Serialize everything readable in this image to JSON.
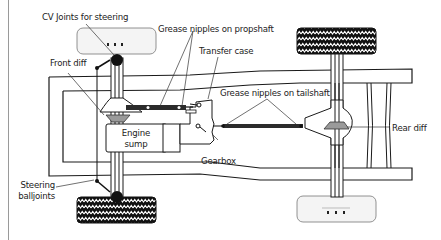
{
  "labels": {
    "cv_joints": "CV Joints for steering",
    "grease_propshaft": "Grease nipples on propshaft",
    "transfer_case": "Transfer case",
    "front_diff": "Front diff",
    "grease_tailshaft": "Grease nipples on tailshaft",
    "engine_sump_line1": "Engine",
    "engine_sump_line2": "sump",
    "rear_diff": "Rear diff",
    "gearbox": "Gearbox",
    "steering_balljoints_line1": "Steering",
    "steering_balljoints_line2": "balljoints"
  },
  "colors": {
    "outline": "#1a1a1a",
    "shaft": "#2b2b2b",
    "diff_fill": "#9a9a9a",
    "ghost_wheel": "#f3f3f3",
    "rule": "#9a9a9a"
  }
}
